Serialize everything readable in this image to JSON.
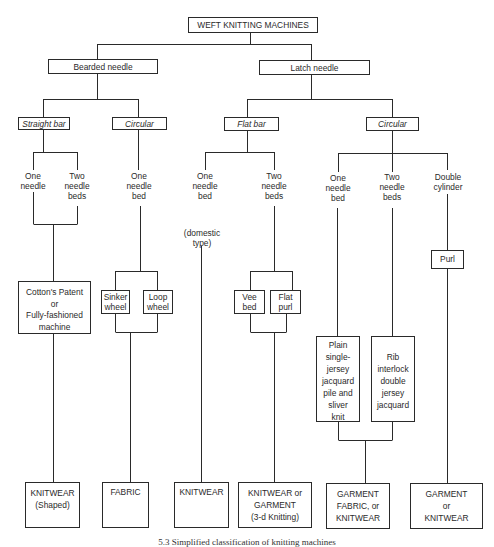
{
  "title": "WEFT KNITTING MACHINES",
  "needle_types": {
    "bearded": "Bearded needle",
    "latch": "Latch needle"
  },
  "machine_types": {
    "straight_bar": "Straight bar",
    "circular_bearded": "Circular",
    "flat_bar": "Flat bar",
    "circular_latch": "Circular"
  },
  "needle_beds": {
    "sb_one": "One\nneedle",
    "sb_two": "Two\nneedle\nbeds",
    "cb_one": "One\nneedle\nbed",
    "fb_one": "One\nneedle\nbed",
    "fb_two": "Two\nneedle\nbeds",
    "cl_one": "One\nneedle\nbed",
    "cl_two": "Two\nneedle\nbeds",
    "cl_double": "Double\ncylinder"
  },
  "notes": {
    "domestic": "(domestic\ntype)"
  },
  "machines": {
    "cottons_patent": "Cotton's Patent\nor\nFully-fashioned\nmachine",
    "sinker_wheel": "Sinker\nwheel",
    "loop_wheel": "Loop\nwheel",
    "vee_bed": "Vee\nbed",
    "flat_purl": "Flat\npurl",
    "plain_single": "Plain\nsingle-\njersey\njacquard\npile and\nsliver\nknit",
    "rib_interlock": "Rib\ninterlock\ndouble\njersey\njacquard",
    "purl": "Purl"
  },
  "products": {
    "p1": "KNITWEAR\n(Shaped)",
    "p2": "FABRIC",
    "p3": "KNITWEAR",
    "p4": "KNITWEAR or\nGARMENT\n(3-d Knitting)",
    "p5": "GARMENT\nFABRIC, or\nKNITWEAR",
    "p6": "GARMENT\nor\nKNITWEAR"
  },
  "caption": "5.3   Simplified classification of knitting machines"
}
